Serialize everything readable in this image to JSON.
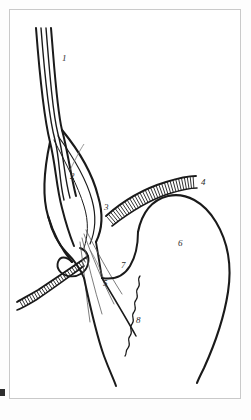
{
  "figure": {
    "background_color": "#ffffff",
    "frame_color": "#c9c9c9",
    "ink_color": "#1a1a1a",
    "label_color": "#2b2b2b"
  },
  "labels": [
    {
      "id": "label-1",
      "text": "1",
      "x": 62,
      "y": 54
    },
    {
      "id": "label-2",
      "text": "2",
      "x": 70,
      "y": 172
    },
    {
      "id": "label-3",
      "text": "3",
      "x": 104,
      "y": 203
    },
    {
      "id": "label-4",
      "text": "4",
      "x": 201,
      "y": 178
    },
    {
      "id": "label-5",
      "text": "5",
      "x": 103,
      "y": 279
    },
    {
      "id": "label-6",
      "text": "6",
      "x": 178,
      "y": 239
    },
    {
      "id": "label-7",
      "text": "7",
      "x": 121,
      "y": 261
    },
    {
      "id": "label-8",
      "text": "8",
      "x": 136,
      "y": 316
    }
  ],
  "leaders": [
    {
      "id": "leader-2",
      "path": "M 70 170 C 76 158 80 150 84 144"
    },
    {
      "id": "leader-5",
      "path": "M 103 277 C 99 266 95 258 90 250"
    }
  ],
  "strokes": {
    "tube_outer_left": "M 36 28 C 40 80 44 118 50 142 C 56 166 56 186 62 208 C 66 224 70 236 74 246",
    "tube_inner_left": "M 41 28 C 45 80 49 118 55 140 C 60 160 59 180 64 200",
    "tube_inner_right": "M 46 28 C 50 78 53 114 58 134 C 64 156 64 176 70 198",
    "tube_outer_right": "M 51 28 C 55 76 57 110 62 130 C 68 152 70 172 76 196",
    "bulb_left": "M 50 142 C 44 170 42 196 48 216 C 54 236 62 250 72 262",
    "bulb_right": "M 62 130 C 80 152 92 172 98 196 C 104 216 102 230 96 242",
    "bulb_inner_a": "M 58 136 C 74 158 86 178 92 200 C 97 218 95 232 90 244",
    "bulb_inner_b": "M 54 140 C 66 164 78 186 84 206 C 89 222 88 236 84 248",
    "neck_left": "M 48 216 C 52 232 58 244 66 252 C 74 260 80 268 84 278",
    "neck_right": "M 96 242 C 98 254 100 266 102 278",
    "loop_hook": "M 72 262 C 66 256 60 256 58 262 C 56 268 60 274 68 276 C 78 278 86 272 88 264 C 90 256 86 250 80 248",
    "fan_line_a": "M 86 230 C 96 250 108 272 122 294",
    "fan_line_b": "M 84 234 C 92 256 102 280 114 304",
    "fan_line_c": "M 82 238 C 88 262 94 288 102 314",
    "fan_line_d": "M 80 242 C 84 268 86 296 90 322",
    "lower_body_left": "M 84 278 C 90 306 96 334 104 356 C 110 372 114 380 116 386",
    "lower_body_right": "M 102 278 C 114 298 126 318 136 336",
    "flap_7": "M 102 278 C 114 280 124 276 130 266 C 136 256 138 244 138 232",
    "dome_curve": "M 138 232 C 142 212 152 200 168 196 C 186 192 204 202 216 222 C 228 242 232 266 228 292 C 224 318 214 346 204 368 C 200 376 198 380 197 383",
    "band_upper": "M 106 216 C 124 200 146 188 166 182 C 182 177 192 176 196 176",
    "band_upper_edge": "M 112 226 C 130 212 150 200 168 194 C 184 189 193 188 197 188",
    "band_lower": "M 88 256 C 74 266 56 278 38 290 C 26 297 20 300 17 302",
    "band_lower_edge": "M 84 266 C 70 276 54 288 36 300 C 26 306 20 309 17 310",
    "wavy_line": "M 140 276 C 136 280 142 284 138 288 C 134 292 140 296 136 300 C 132 304 138 308 134 312 C 130 316 136 320 132 324 C 128 328 134 332 130 336 C 126 340 132 344 128 348 C 125 351 127 354 125 356"
  },
  "hatching": {
    "upper_band": {
      "count": 34,
      "description": "parallel ticks across upper ligament band"
    },
    "lower_band": {
      "count": 30,
      "description": "parallel ticks across lower ligament band"
    }
  }
}
